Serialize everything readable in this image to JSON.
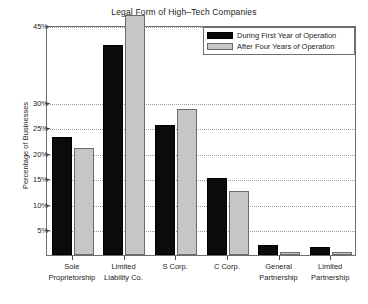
{
  "chart_data": {
    "type": "bar",
    "title": "Legal Form of High–Tech Companies",
    "xlabel": "",
    "ylabel": "Percentage of Businesses",
    "ylim": [
      0,
      45
    ],
    "grid": true,
    "legend_position": "top-right",
    "categories": [
      "Sole Proprietorship",
      "Limited Liability Co.",
      "S Corp.",
      "C Corp.",
      "General Partnership",
      "Limited Partnership"
    ],
    "category_lines": [
      [
        "Sole",
        "Proprietorship"
      ],
      [
        "Limited",
        "Liability Co."
      ],
      [
        "S Corp.",
        ""
      ],
      [
        "C Corp.",
        ""
      ],
      [
        "General",
        "Partnership"
      ],
      [
        "Limited",
        "Partnership"
      ]
    ],
    "ytick_labels": [
      "5%",
      "10%",
      "15%",
      "20%",
      "25%",
      "30%",
      "45%"
    ],
    "ytick_values": [
      5,
      10,
      15,
      20,
      25,
      30,
      45
    ],
    "series": [
      {
        "name": "During First Year of Operation",
        "color": "#0b0b0b",
        "values": [
          23,
          41,
          25.5,
          15,
          2,
          1.5
        ]
      },
      {
        "name": "After Four Years of Operation",
        "color": "#c6c6c6",
        "values": [
          21,
          47,
          28.5,
          12.5,
          0.5,
          0.5
        ]
      }
    ]
  },
  "legend": {
    "items": [
      {
        "label": "During First Year of Operation",
        "swatch": "black-swatch"
      },
      {
        "label": "After Four Years of Operation",
        "swatch": "gray-swatch"
      }
    ]
  }
}
